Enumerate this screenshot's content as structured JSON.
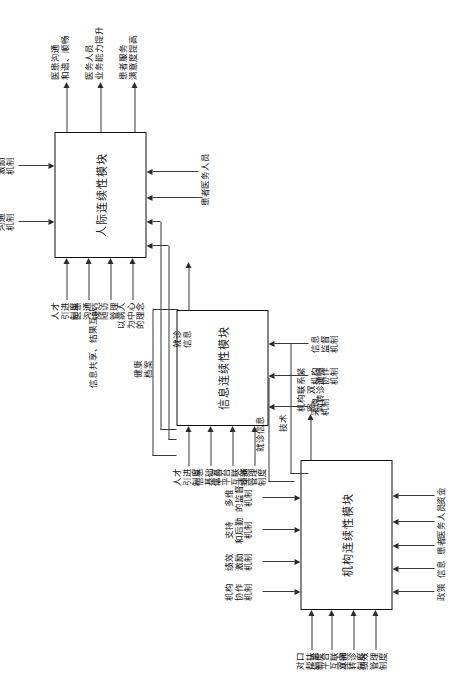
{
  "diagram": {
    "orientation": "rotated-90",
    "modules": [
      {
        "id": "institution",
        "label": "机构连续性模块"
      },
      {
        "id": "information",
        "label": "信息连续性模块"
      },
      {
        "id": "interpersonal",
        "label": "人际连续性模块"
      }
    ],
    "institution_module": {
      "label": "机构连续性模块",
      "top_inputs": [
        "对口\n帮扶\n制度",
        "信息\n平台\n互联\n互通",
        "双向\n转诊\n制度",
        "绩效\n管理\n制度"
      ],
      "bottom_inputs": [
        "政策",
        "信息",
        "患者",
        "医务人员",
        "资金"
      ],
      "side_inputs": [
        "机构\n协作\n机制",
        "绩效\n激励\n机制",
        "支持\n和后勤\n机制",
        "多维\n的监督\n机制"
      ],
      "output": "机构联系紧密、双\n向转诊通畅"
    },
    "information_module": {
      "label": "信息连续性模块",
      "top_inputs": [
        "人才\n引进\n制度",
        "信息\n基础\n平台",
        "信息\n平台\n互联\n互通",
        "绩效\n管理\n制度"
      ],
      "bottom_inputs": [
        "采购\n机制",
        "机构\n协作\n机制",
        "信息\n监督\n机制",
        "健康\n档案"
      ],
      "output": "信息共享、结果互认"
    },
    "interpersonal_module": {
      "label": "人际连续性模块",
      "top_inputs": [
        "人才\n引进\n制度",
        "医患\n沟通\n规范",
        "随访\n管理",
        "以病人\n为中心\n的理念"
      ],
      "bottom_inputs": [
        "就诊\n信息",
        "健康\n档案",
        "患者",
        "医务人员"
      ],
      "side_inputs": [
        "医患\n沟通\n机制",
        "绩效\n激励\n机制"
      ],
      "outputs": [
        "医患沟通\n和谐、顺畅",
        "医务人员\n业务能力提升",
        "患者服务\n满意度提高"
      ]
    },
    "flow_labels": {
      "tech": "技术",
      "visit_info_1": "就诊信息",
      "visit_info_2": "医务人员",
      "visit_info_mid": "就诊\n信息",
      "health_record": "健康\n档案",
      "talent": "人才\n引进\n制度"
    },
    "colors": {
      "stroke": "#2b2b2b",
      "box": "#111111",
      "background": "#ffffff"
    }
  }
}
